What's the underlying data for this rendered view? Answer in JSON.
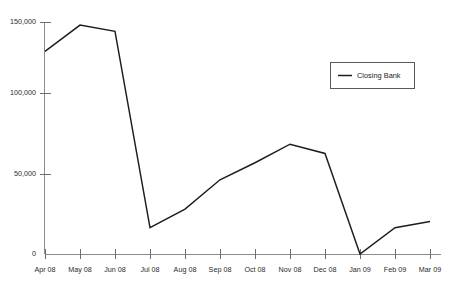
{
  "chart_data": {
    "type": "line",
    "title": "",
    "subtitle": "",
    "xlabel": "",
    "ylabel": "",
    "categories": [
      "Apr 08",
      "May 08",
      "Jun 08",
      "Jul 08",
      "Aug 08",
      "Sep 08",
      "Oct 08",
      "Nov 08",
      "Dec 08",
      "Jan 09",
      "Feb 09",
      "Mar 09"
    ],
    "series": [
      {
        "name": "Closing Bank",
        "color": "#1d1d1d",
        "values": [
          131000,
          148000,
          144000,
          17000,
          29000,
          48000,
          59000,
          71000,
          65000,
          0,
          17000,
          21000
        ]
      }
    ],
    "ylim": [
      0,
      150000
    ],
    "yticks": [
      0,
      50000,
      100000,
      150000
    ],
    "ytick_labels": [
      "0",
      "50,000",
      "100,000",
      "150,000"
    ],
    "grid": false,
    "legend": {
      "position": "top-right",
      "entries": [
        {
          "label": "Closing Bank",
          "color": "#1d1d1d",
          "marker": "line"
        }
      ]
    }
  },
  "legend": {
    "entry_label": "Closing Bank"
  },
  "axes": {
    "y_labels": [
      "150,000",
      "100,000",
      "50,000",
      "0"
    ],
    "x_labels": [
      "Apr 08",
      "May 08",
      "Jun 08",
      "Jul 08",
      "Aug 08",
      "Sep 08",
      "Oct 08",
      "Nov 08",
      "Dec 08",
      "Jan 09",
      "Feb 09",
      "Mar 09"
    ]
  },
  "colors": {
    "series_line": "#1d1d1d",
    "axis": "#8c8c8c",
    "tick": "#6e6e6e",
    "text": "#2b2b2b",
    "background": "#ffffff"
  }
}
